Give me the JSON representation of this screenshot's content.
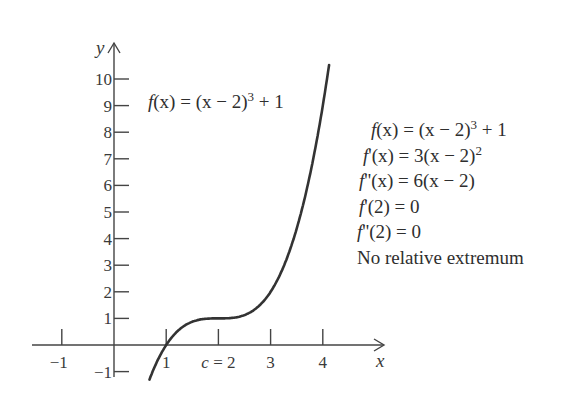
{
  "chart_data": {
    "type": "line",
    "title": "",
    "function": "f(x) = (x - 2)^3 + 1",
    "xlabel": "x",
    "ylabel": "y",
    "xlim": [
      -1.5,
      5.2
    ],
    "ylim": [
      -1.5,
      11.5
    ],
    "x_ticks": [
      -1,
      1,
      2,
      3,
      4
    ],
    "x_tick_labels": [
      "−1",
      "1",
      "c = 2",
      "3",
      "4"
    ],
    "y_ticks": [
      -1,
      1,
      2,
      3,
      4,
      5,
      6,
      7,
      8,
      9,
      10
    ],
    "y_tick_labels": [
      "−1",
      "1",
      "2",
      "3",
      "4",
      "5",
      "6",
      "7",
      "8",
      "9",
      "10"
    ],
    "grid": false,
    "series": [
      {
        "name": "f(x) = (x − 2)^3 + 1",
        "x": [
          0.7,
          0.8,
          1.0,
          1.2,
          1.4,
          1.6,
          1.8,
          2.0,
          2.2,
          2.4,
          2.6,
          2.8,
          3.0,
          3.2,
          3.4,
          3.6,
          3.8,
          4.0,
          4.1
        ],
        "values": [
          -1.197,
          -0.728,
          0.0,
          0.488,
          0.784,
          0.936,
          0.992,
          1.0,
          1.008,
          1.064,
          1.216,
          1.512,
          2.0,
          2.728,
          3.744,
          5.096,
          6.832,
          9.0,
          10.261
        ]
      }
    ],
    "annotations": [
      "f(x) = (x − 2)^3 + 1",
      "f'(x) = 3(x − 2)^2",
      "f''(x) = 6(x − 2)",
      "f'(2) = 0",
      "f''(2) = 0",
      "No relative extremum"
    ]
  },
  "axes": {
    "x_label": "x",
    "y_label": "y",
    "x_ticks": [
      {
        "value": -1,
        "label": "−1"
      },
      {
        "value": 1,
        "label": "1"
      },
      {
        "value": 2,
        "label": "c = 2"
      },
      {
        "value": 3,
        "label": "3"
      },
      {
        "value": 4,
        "label": "4"
      }
    ],
    "y_ticks": [
      {
        "value": 10,
        "label": "10"
      },
      {
        "value": 9,
        "label": "9"
      },
      {
        "value": 8,
        "label": "8"
      },
      {
        "value": 7,
        "label": "7"
      },
      {
        "value": 6,
        "label": "6"
      },
      {
        "value": 5,
        "label": "5"
      },
      {
        "value": 4,
        "label": "4"
      },
      {
        "value": 3,
        "label": "3"
      },
      {
        "value": 2,
        "label": "2"
      },
      {
        "value": 1,
        "label": "1"
      },
      {
        "value": -1,
        "label": "−1"
      }
    ]
  },
  "curve_label": {
    "f": "f",
    "paren": "(x) = (x − 2)",
    "exp": "3",
    "tail": " + 1"
  },
  "facts": {
    "line1": {
      "f": "f",
      "rest": "(x) = (x − 2)",
      "exp": "3",
      "tail": " + 1"
    },
    "line2": {
      "f": "f",
      "rest": "'(x) = 3(x − 2)",
      "exp": "2"
    },
    "line3": {
      "f": "f",
      "rest": "''(x) = 6(x − 2)"
    },
    "line4": {
      "f": "f",
      "rest": "'(2) = 0"
    },
    "line5": {
      "f": "f",
      "rest": "''(2) = 0"
    },
    "line6": "No relative extremum"
  },
  "colors": {
    "axis": "#444444",
    "curve": "#333333",
    "text": "#2e2e2e"
  }
}
